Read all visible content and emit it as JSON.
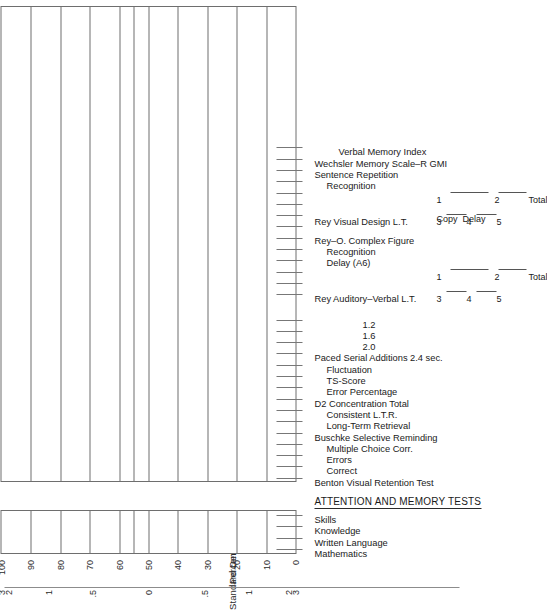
{
  "form": {
    "section_heading": "ATTENTION AND MEMORY TESTS"
  },
  "axes": {
    "standard_deviation": {
      "title": "Standard Deviation",
      "ticks": [
        "3",
        "2",
        "1",
        ".5",
        "0",
        ".5",
        "1",
        "2",
        "3"
      ]
    },
    "percentile_rank": {
      "title": "Percentile Rank",
      "ticks": [
        "0",
        "10",
        "20",
        "30",
        "40",
        "50",
        "60",
        "70",
        "80",
        "90",
        "100"
      ]
    }
  },
  "grid": {
    "narrow_box_label": "narrow-score-grid",
    "wide_box_label": "wide-profile-grid",
    "percentile_lines": [
      0,
      10,
      20,
      30,
      40,
      50,
      55,
      60,
      70,
      80,
      90,
      100
    ]
  },
  "achievement_rows": [
    {
      "label": "Mathematics"
    },
    {
      "label": "Written Language"
    },
    {
      "label": "Knowledge"
    },
    {
      "label": "Skills"
    }
  ],
  "attention_memory_rows": [
    {
      "label": "Benton Visual Retention Test",
      "indent": 0
    },
    {
      "label": "Correct",
      "indent": 1
    },
    {
      "label": "Errors",
      "indent": 1
    },
    {
      "label": "Multiple Choice Corr.",
      "indent": 1
    },
    {
      "label": "Buschke Selective Reminding",
      "indent": 0
    },
    {
      "label": "Long-Term Retrieval",
      "indent": 1
    },
    {
      "label": "Consistent L.T.R.",
      "indent": 1
    },
    {
      "label": "D2 Concentration Total",
      "indent": 0
    },
    {
      "label": "Error Percentage",
      "indent": 1
    },
    {
      "label": "TS-Score",
      "indent": 1
    },
    {
      "label": "Fluctuation",
      "indent": 1
    },
    {
      "label": "Paced Serial Additions 2.4 sec.",
      "indent": 0
    },
    {
      "label": "2.0",
      "indent": 2
    },
    {
      "label": "1.6",
      "indent": 2
    },
    {
      "label": "1.2",
      "indent": 2
    }
  ],
  "memory_tests": [
    {
      "name": "Rey Auditory–Verbal L.T.",
      "trials_top": [
        "1",
        "2"
      ],
      "trials_bottom": [
        "3",
        "4",
        "5"
      ],
      "total_label": "Total"
    },
    {
      "name": "Delay (A6)"
    },
    {
      "name": "Recognition"
    },
    {
      "name": "Rey–O. Complex Figure",
      "parts": [
        "Copy",
        "Delay"
      ]
    },
    {
      "name": "Rey Visual Design L.T.",
      "trials_top": [
        "1",
        "2"
      ],
      "trials_bottom": [
        "3",
        "4",
        "5"
      ],
      "total_label": "Total"
    },
    {
      "name": "Recognition"
    },
    {
      "name": "Sentence Repetition"
    },
    {
      "name": "Wechsler Memory Scale–R GMI"
    },
    {
      "name": "Verbal Memory Index"
    }
  ],
  "colors": {
    "rule": "#6e6e6e",
    "text": "#1a1a1a",
    "tick": "#777777",
    "paper": "#ffffff"
  }
}
